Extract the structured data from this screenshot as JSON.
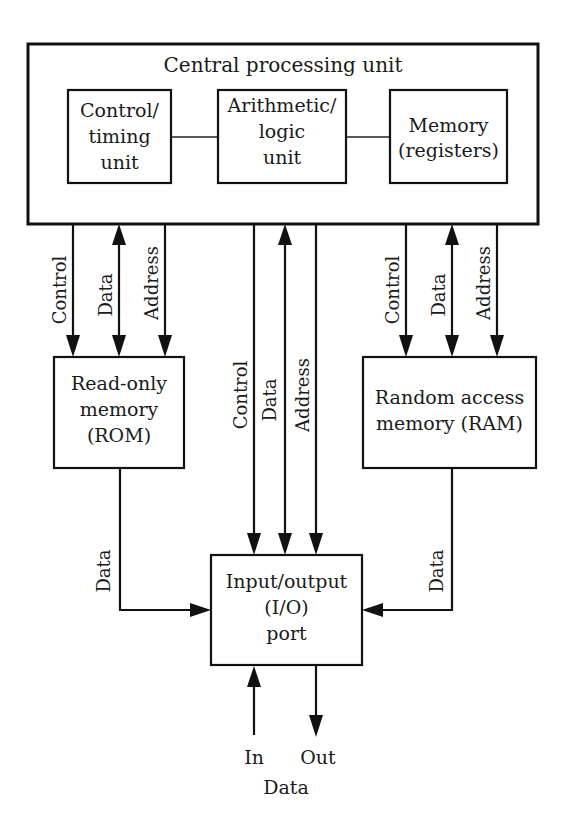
{
  "cpu": {
    "title": "Central processing unit",
    "control_timing": {
      "line1": "Control/",
      "line2": "timing",
      "line3": "unit"
    },
    "alu": {
      "line1": "Arithmetic/",
      "line2": "logic",
      "line3": "unit"
    },
    "registers": {
      "line1": "Memory",
      "line2": "(registers)"
    }
  },
  "rom": {
    "line1": "Read-only",
    "line2": "memory",
    "line3": "(ROM)"
  },
  "ram": {
    "line1": "Random access",
    "line2": "memory (RAM)"
  },
  "io": {
    "line1": "Input/output",
    "line2": "(I/O)",
    "line3": "port"
  },
  "buses": {
    "left": {
      "control": "Control",
      "data": "Data",
      "address": "Address"
    },
    "middle": {
      "control": "Control",
      "data": "Data",
      "address": "Address"
    },
    "right": {
      "control": "Control",
      "data": "Data",
      "address": "Address"
    },
    "rom_to_io": "Data",
    "ram_to_io": "Data"
  },
  "external": {
    "in": "In",
    "out": "Out",
    "data": "Data"
  },
  "colors": {
    "stroke": "#111111",
    "background": "#ffffff"
  }
}
